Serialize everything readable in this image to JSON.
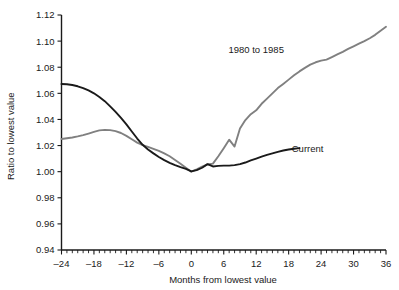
{
  "chart_data": {
    "type": "line",
    "title": "",
    "xlabel": "Months from lowest value",
    "ylabel": "Ratio to lowest value",
    "xlim": [
      -24,
      36
    ],
    "ylim": [
      0.94,
      1.12
    ],
    "xticks": [
      -24,
      -18,
      -12,
      -6,
      0,
      6,
      12,
      18,
      24,
      30,
      36
    ],
    "xtick_labels": [
      "–24",
      "–18",
      "–12",
      "–6",
      "0",
      "6",
      "12",
      "18",
      "24",
      "30",
      "36"
    ],
    "yticks": [
      0.94,
      0.96,
      0.98,
      1.0,
      1.02,
      1.04,
      1.06,
      1.08,
      1.1,
      1.12
    ],
    "ytick_labels": [
      "0.94",
      "0.96",
      "0.98",
      "1.00",
      "1.02",
      "1.04",
      "1.06",
      "1.08",
      "1.10",
      "1.12"
    ],
    "minor_xtick_interval": 1,
    "grid": false,
    "legend_position": "inline-annotations",
    "series": [
      {
        "name": "1980 to 1985",
        "color": "#808080",
        "label_x": 12,
        "label_y": 1.0935,
        "x": [
          -24,
          -23,
          -22,
          -21,
          -20,
          -19,
          -18,
          -17,
          -16,
          -15,
          -14,
          -13,
          -12,
          -11,
          -10,
          -9,
          -8,
          -7,
          -6,
          -5,
          -4,
          -3,
          -2,
          -1,
          0,
          1,
          2,
          3,
          4,
          5,
          6,
          7,
          8,
          9,
          10,
          11,
          12,
          13,
          14,
          15,
          16,
          17,
          18,
          19,
          20,
          21,
          22,
          23,
          24,
          25,
          26,
          27,
          28,
          29,
          30,
          31,
          32,
          33,
          34,
          35,
          36
        ],
        "y": [
          1.025,
          1.0256,
          1.0262,
          1.027,
          1.028,
          1.0292,
          1.0305,
          1.0316,
          1.032,
          1.0318,
          1.031,
          1.0296,
          1.0274,
          1.0248,
          1.0222,
          1.0204,
          1.019,
          1.0175,
          1.016,
          1.014,
          1.0118,
          1.009,
          1.006,
          1.003,
          1.0,
          1.0018,
          1.0038,
          1.0055,
          1.0062,
          1.0118,
          1.018,
          1.0245,
          1.0192,
          1.033,
          1.0395,
          1.044,
          1.047,
          1.052,
          1.056,
          1.06,
          1.064,
          1.0672,
          1.0705,
          1.0738,
          1.0768,
          1.0795,
          1.082,
          1.0838,
          1.085,
          1.0858,
          1.0878,
          1.0898,
          1.0918,
          1.094,
          1.096,
          1.098,
          1.1,
          1.1022,
          1.1048,
          1.108,
          1.111
        ]
      },
      {
        "name": "Current",
        "color": "#1a1a1a",
        "label_x": 21.5,
        "label_y": 1.0178,
        "x": [
          -24,
          -23,
          -22,
          -21,
          -20,
          -19,
          -18,
          -17,
          -16,
          -15,
          -14,
          -13,
          -12,
          -11,
          -10,
          -9,
          -8,
          -7,
          -6,
          -5,
          -4,
          -3,
          -2,
          -1,
          0,
          1,
          2,
          3,
          4,
          5,
          6,
          7,
          8,
          9,
          10,
          11,
          12,
          13,
          14,
          15,
          16,
          17,
          18,
          19,
          20
        ],
        "y": [
          1.0672,
          1.067,
          1.0664,
          1.0654,
          1.064,
          1.0622,
          1.06,
          1.0572,
          1.054,
          1.05,
          1.0458,
          1.0412,
          1.0362,
          1.0308,
          1.0254,
          1.0206,
          1.017,
          1.014,
          1.0112,
          1.0088,
          1.0068,
          1.005,
          1.0035,
          1.0022,
          1.0002,
          1.0012,
          1.003,
          1.0058,
          1.004,
          1.0044,
          1.0046,
          1.0046,
          1.005,
          1.0058,
          1.007,
          1.0086,
          1.01,
          1.0115,
          1.0128,
          1.014,
          1.0152,
          1.0162,
          1.017,
          1.0176,
          1.018
        ]
      }
    ]
  }
}
